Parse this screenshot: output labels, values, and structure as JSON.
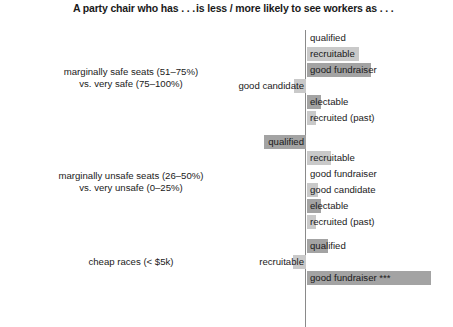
{
  "header": {
    "left": "A party chair who has . . .",
    "right": "is less / more likely to see workers as . . ."
  },
  "chart_data": {
    "type": "bar",
    "orientation": "horizontal",
    "title": "",
    "subtitle": "",
    "xlabel": "",
    "ylabel": "",
    "grid": false,
    "legend": null,
    "axis": {
      "zero_line": true,
      "zero_line_px": 306,
      "px_per_unit": 1,
      "note": "Diverging bars around a central zero line; left = less likely, right = more likely"
    },
    "series_colors": {
      "light": "#c9c9c9",
      "dark": "#a3a3a3"
    },
    "groups": [
      {
        "label_line1": "marginally safe seats (51–75%)",
        "label_line2": "vs. very safe (75–100%)",
        "bars": [
          {
            "label": "qualified",
            "value": 0,
            "shade": "light"
          },
          {
            "label": "recruitable",
            "value": 52,
            "shade": "light"
          },
          {
            "label": "good fundraiser",
            "value": 64,
            "shade": "dark"
          },
          {
            "label": "good candidate",
            "value": -12,
            "shade": "light"
          },
          {
            "label": "electable",
            "value": 14,
            "shade": "dark"
          },
          {
            "label": "recruited (past)",
            "value": 9,
            "shade": "light"
          }
        ]
      },
      {
        "label_line1": "marginally unsafe seats (26–50%)",
        "label_line2": "vs. very unsafe (0–25%)",
        "bars": [
          {
            "label": "qualified",
            "value": -42,
            "shade": "dark"
          },
          {
            "label": "recruitable",
            "value": 24,
            "shade": "light"
          },
          {
            "label": "good fundraiser",
            "value": 0,
            "shade": "light"
          },
          {
            "label": "good candidate",
            "value": 11,
            "shade": "light"
          },
          {
            "label": "electable",
            "value": 14,
            "shade": "dark"
          },
          {
            "label": "recruited (past)",
            "value": 9,
            "shade": "light"
          }
        ]
      },
      {
        "label_line1": "cheap races (< $5k)",
        "label_line2": "",
        "bars": [
          {
            "label": "qualified",
            "value": 21,
            "shade": "dark"
          },
          {
            "label": "recruitable",
            "value": -13,
            "shade": "light"
          },
          {
            "label": "good fundraiser ***",
            "value": 124,
            "shade": "dark"
          }
        ]
      }
    ]
  }
}
